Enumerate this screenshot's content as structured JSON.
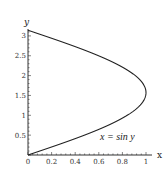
{
  "chart_data": {
    "type": "line",
    "title": "",
    "xlabel": "x",
    "ylabel": "y",
    "xlim": [
      0,
      1.05
    ],
    "ylim": [
      0,
      3.2
    ],
    "grid": false,
    "legend": null,
    "x_ticks": [
      "0",
      "0.2",
      "0.4",
      "0.6",
      "0.8",
      "1"
    ],
    "y_ticks": [
      "0.5",
      "1",
      "1.5",
      "2",
      "2.5",
      "3"
    ],
    "annotation": "x = sin y",
    "series": [
      {
        "name": "x = sin y",
        "parametric": "x = sin(y), 0 <= y <= pi",
        "points": [
          [
            0,
            0
          ],
          [
            0.2474,
            0.25
          ],
          [
            0.4794,
            0.5
          ],
          [
            0.6816,
            0.75
          ],
          [
            0.8415,
            1.0
          ],
          [
            0.949,
            1.25
          ],
          [
            0.9975,
            1.5
          ],
          [
            1.0,
            1.5708
          ],
          [
            0.984,
            1.75
          ],
          [
            0.9093,
            2.0
          ],
          [
            0.7781,
            2.25
          ],
          [
            0.5985,
            2.5
          ],
          [
            0.3817,
            2.75
          ],
          [
            0.1411,
            3.0
          ],
          [
            0,
            3.1416
          ]
        ]
      }
    ],
    "extra_lines": [
      {
        "name": "y-axis segment",
        "from": [
          0,
          0
        ],
        "to": [
          0,
          3.1416
        ]
      }
    ]
  },
  "labels": {
    "x_axis": "x",
    "y_axis": "y",
    "annotation": "x = sin y"
  }
}
